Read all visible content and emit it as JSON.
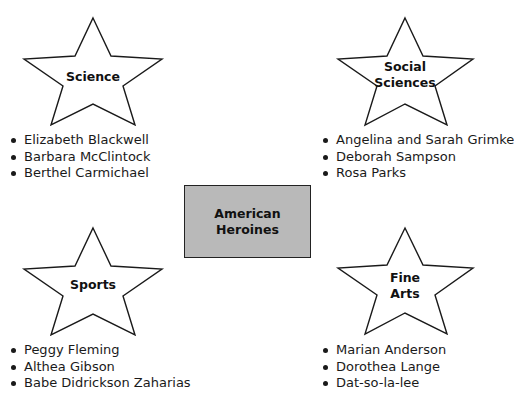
{
  "center": {
    "line1": "American",
    "line2": "Heroines",
    "fill_color": "#b9b9b9"
  },
  "categories": [
    {
      "id": "science",
      "label_lines": [
        "Science"
      ],
      "items": [
        "Elizabeth Blackwell",
        "Barbara McClintock",
        "Berthel Carmichael"
      ]
    },
    {
      "id": "social-sciences",
      "label_lines": [
        "Social",
        "Sciences"
      ],
      "items": [
        "Angelina and Sarah Grimke",
        "Deborah Sampson",
        "Rosa Parks"
      ]
    },
    {
      "id": "sports",
      "label_lines": [
        "Sports"
      ],
      "items": [
        "Peggy Fleming",
        "Althea Gibson",
        "Babe Didrickson Zaharias"
      ]
    },
    {
      "id": "fine-arts",
      "label_lines": [
        "Fine",
        "Arts"
      ],
      "items": [
        "Marian Anderson",
        "Dorothea Lange",
        "Dat-so-la-lee"
      ]
    }
  ]
}
